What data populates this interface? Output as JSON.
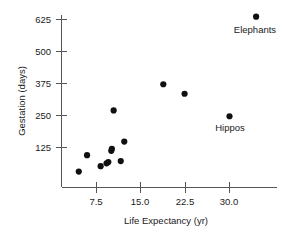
{
  "chart_data": {
    "type": "scatter",
    "title": "",
    "xlabel": "Life Expectancy (yr)",
    "ylabel": "Gestation (days)",
    "xlim": [
      3.0,
      37.0
    ],
    "ylim": [
      0,
      680
    ],
    "xticks": [
      7.5,
      15.0,
      22.5,
      30.0
    ],
    "xticklabels": [
      "7.5",
      "15.0",
      "22.5",
      "30.0"
    ],
    "yticks": [
      125,
      250,
      375,
      500,
      625
    ],
    "yticklabels": [
      "125",
      "250",
      "375",
      "500",
      "625"
    ],
    "grid": false,
    "legend": null,
    "marker": "filled-circle",
    "marker_color": "#101010",
    "points": [
      {
        "x": 4.5,
        "y": 31
      },
      {
        "x": 5.9,
        "y": 95
      },
      {
        "x": 8.2,
        "y": 52
      },
      {
        "x": 9.2,
        "y": 63
      },
      {
        "x": 9.5,
        "y": 68
      },
      {
        "x": 10.0,
        "y": 112
      },
      {
        "x": 10.1,
        "y": 120
      },
      {
        "x": 10.4,
        "y": 270
      },
      {
        "x": 11.6,
        "y": 72
      },
      {
        "x": 12.2,
        "y": 148
      },
      {
        "x": 18.8,
        "y": 372
      },
      {
        "x": 22.4,
        "y": 335
      },
      {
        "x": 30.0,
        "y": 247
      },
      {
        "x": 34.5,
        "y": 636
      }
    ],
    "annotations": [
      {
        "text": "Elephants",
        "x": 34.5,
        "y": 636,
        "position": "below"
      },
      {
        "text": "Hippos",
        "x": 30.0,
        "y": 247,
        "position": "below"
      }
    ]
  },
  "axes": {
    "x_title": "Life Expectancy (yr)",
    "y_title": "Gestation (days)",
    "x_tick_labels": [
      "7.5",
      "15.0",
      "22.5",
      "30.0"
    ],
    "y_tick_labels": [
      "125",
      "250",
      "375",
      "500",
      "625"
    ]
  },
  "labels": {
    "elephants": "Elephants",
    "hippos": "Hippos"
  }
}
